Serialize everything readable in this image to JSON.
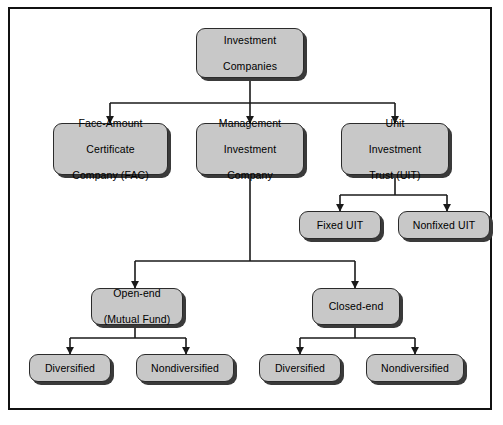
{
  "figure": {
    "type": "organizational-tree-diagram",
    "frame_color": "#111111",
    "node_fill": "#c8c8c8",
    "node_border": "#2b2b2b",
    "node_shadow": "#3a3a3a",
    "connector_color": "#1a1a1a",
    "background": "#ffffff"
  },
  "nodes": {
    "root": {
      "label": "Investment\nCompanies",
      "line1": "Investment",
      "line2": "Companies"
    },
    "face_amount": {
      "line1": "Face-Amount",
      "line2": "Certificate",
      "line3": "Company (FAC)"
    },
    "management": {
      "line1": "Management",
      "line2": "Investment",
      "line3": "Company"
    },
    "uit": {
      "line1": "Unit",
      "line2": "Investment",
      "line3": "Trust (UIT)"
    },
    "fixed_uit": {
      "line1": "Fixed UIT"
    },
    "nonfixed_uit": {
      "line1": "Nonfixed UIT"
    },
    "open_end": {
      "line1": "Open-end",
      "line2": "(Mutual Fund)"
    },
    "closed_end": {
      "line1": "Closed-end"
    },
    "open_diversified": {
      "line1": "Diversified"
    },
    "open_nondiversified": {
      "line1": "Nondiversified"
    },
    "closed_diversified": {
      "line1": "Diversified"
    },
    "closed_nondiversified": {
      "line1": "Nondiversified"
    }
  },
  "hierarchy": {
    "parent": "Investment Companies",
    "children": [
      "Face-Amount Certificate Company (FAC)",
      "Management Investment Company",
      "Unit Investment Trust (UIT)"
    ],
    "uit_children": [
      "Fixed UIT",
      "Nonfixed UIT"
    ],
    "management_children": [
      "Open-end (Mutual Fund)",
      "Closed-end"
    ],
    "open_end_children": [
      "Diversified",
      "Nondiversified"
    ],
    "closed_end_children": [
      "Diversified",
      "Nondiversified"
    ]
  }
}
